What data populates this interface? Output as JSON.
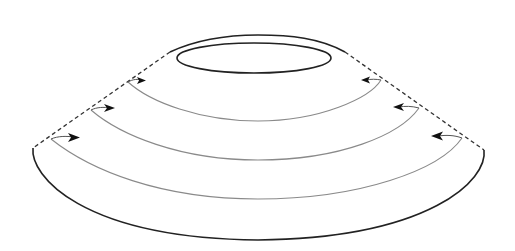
{
  "diagram": {
    "type": "truncated-cone-surface",
    "colors": {
      "background": "#ffffff",
      "outline": "#222222",
      "dashed_edge": "#333333",
      "flow_curve": "#8a8a8a",
      "arrowhead": "#111111"
    },
    "elements": {
      "top_rim": {
        "kind": "solid-arc"
      },
      "top_opening": {
        "kind": "ellipse"
      },
      "left_edge": {
        "kind": "dashed-line"
      },
      "right_edge": {
        "kind": "dashed-line"
      },
      "bottom_rim": {
        "kind": "solid-arc"
      }
    },
    "flow_curves": [
      {
        "index": 1,
        "left_arrow_direction": "right",
        "right_arrow_direction": "left"
      },
      {
        "index": 2,
        "left_arrow_direction": "right",
        "right_arrow_direction": "left"
      },
      {
        "index": 3,
        "left_arrow_direction": "right",
        "right_arrow_direction": "left"
      }
    ]
  }
}
